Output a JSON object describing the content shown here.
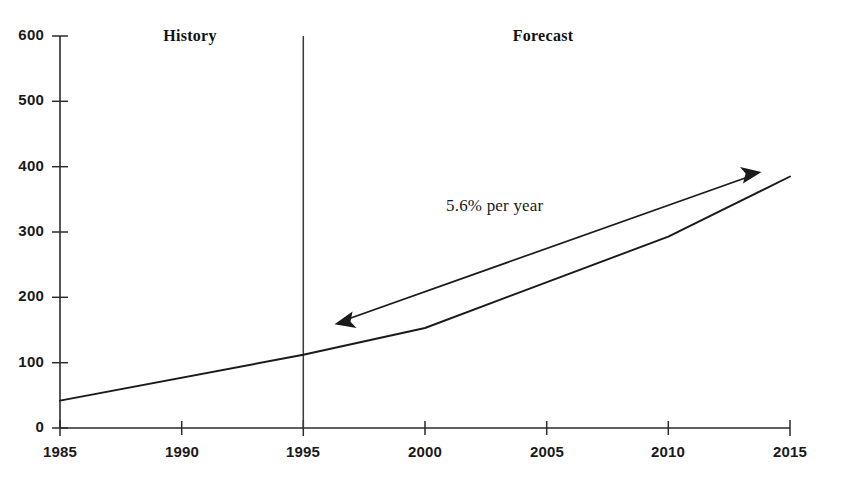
{
  "chart_data": {
    "type": "line",
    "title": "",
    "xlabel": "",
    "ylabel": "",
    "xlim": [
      1985,
      2015
    ],
    "ylim": [
      0,
      600
    ],
    "grid": false,
    "legend": null,
    "x_ticks": [
      "1985",
      "1990",
      "1995",
      "2000",
      "2005",
      "2010",
      "2015"
    ],
    "y_ticks": [
      "0",
      "100",
      "200",
      "300",
      "400",
      "500",
      "600"
    ],
    "series": [
      {
        "name": "projection",
        "x": [
          1985,
          1995,
          2000,
          2010,
          2015
        ],
        "values": [
          42,
          112,
          153,
          293,
          385
        ]
      }
    ],
    "annotations": [
      {
        "text": "History",
        "x": 1990.9,
        "y": 585
      },
      {
        "text": "Forecast",
        "x": 2005.2,
        "y": 585
      },
      {
        "text": "5.6% per year",
        "x": 2002.0,
        "y": 323
      }
    ],
    "divider": {
      "x": 1995,
      "label_left": "History",
      "label_right": "Forecast"
    },
    "growth_arrow": {
      "label": "5.6% per year",
      "from": {
        "x": 1996.4,
        "y": 161
      },
      "to": {
        "x": 2013.6,
        "y": 388
      },
      "double_headed": true
    },
    "colors": {
      "line": "#1a1a1a",
      "axis": "#2b2b2b",
      "arrow": "#1a1a1a",
      "background": "#ffffff"
    }
  },
  "axis_geometry": {
    "x0": 60,
    "x1": 790,
    "y0": 428,
    "y1": 36,
    "x_min": 1985,
    "x_max": 2015,
    "y_min": 0,
    "y_max": 600
  }
}
